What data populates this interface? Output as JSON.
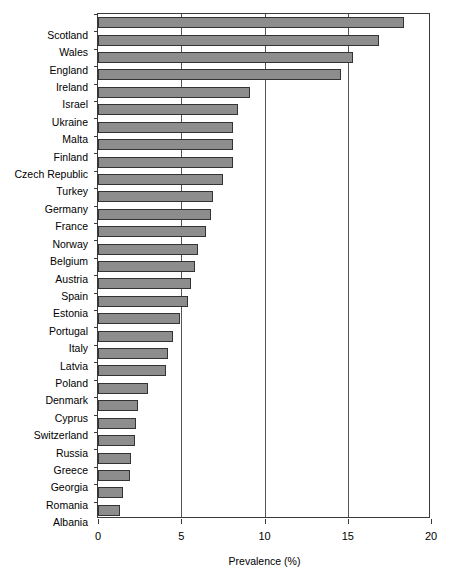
{
  "chart_data": {
    "type": "bar",
    "orientation": "horizontal",
    "title": "",
    "subtitle": "",
    "xlabel": "Prevalence (%)",
    "ylabel": "",
    "xlim": [
      0,
      20
    ],
    "xticks": [
      0,
      5,
      10,
      15,
      20
    ],
    "xtick_labels": [
      "0",
      "5",
      "10",
      "15",
      "20"
    ],
    "grid": "vertical",
    "legend": null,
    "bar_fill_color": "#8d8d8d",
    "bar_edge_color": "#333333",
    "axis_color": "#3a3a3a",
    "categories": [
      "Scotland",
      "Wales",
      "England",
      "Ireland",
      "Israel",
      "Ukraine",
      "Malta",
      "Finland",
      "Czech Republic",
      "Turkey",
      "Germany",
      "France",
      "Norway",
      "Belgium",
      "Austria",
      "Spain",
      "Estonia",
      "Portugal",
      "Italy",
      "Latvia",
      "Poland",
      "Denmark",
      "Cyprus",
      "Switzerland",
      "Russia",
      "Greece",
      "Georgia",
      "Romania",
      "Albania"
    ],
    "values": [
      18.4,
      16.9,
      15.3,
      14.6,
      9.1,
      8.4,
      8.1,
      8.1,
      8.1,
      7.5,
      6.9,
      6.8,
      6.5,
      6.0,
      5.8,
      5.6,
      5.4,
      4.9,
      4.5,
      4.2,
      4.1,
      3.0,
      2.4,
      2.3,
      2.2,
      2.0,
      1.9,
      1.5,
      1.3
    ]
  }
}
